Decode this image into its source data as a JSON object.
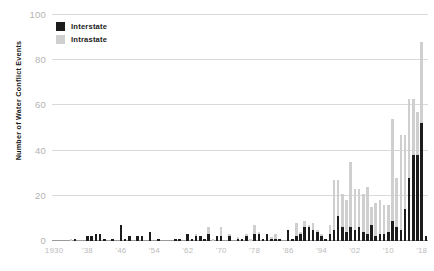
{
  "chart_data": {
    "type": "bar",
    "subtype": "stacked-vertical",
    "title": "",
    "subtitle": "",
    "xlabel": "",
    "ylabel": "Number of Water Conflict Events",
    "ylim": [
      0,
      100
    ],
    "ytick_values": [
      0,
      20,
      40,
      60,
      80,
      100
    ],
    "ytick_labels": [
      "0",
      "20",
      "40",
      "60",
      "80",
      "100"
    ],
    "grid": "horizontal",
    "legend_position": "top-left",
    "colors": {
      "interstate": "#1c1c1c",
      "intrastate": "#cfcfcf",
      "gridline": "#d9d9d9",
      "axis_text": "#bdbdbd",
      "label_text": "#1a1a1a",
      "background": "#ffffff"
    },
    "xtick_labels": [
      "1930",
      "'38",
      "'46",
      "'54",
      "'62",
      "'70",
      "'78",
      "'86",
      "'94",
      "'02",
      "'10",
      "'18"
    ],
    "xtick_years": [
      1930,
      1938,
      1946,
      1954,
      1962,
      1970,
      1978,
      1986,
      1994,
      2002,
      2010,
      2018
    ],
    "x": [
      1930,
      1931,
      1932,
      1933,
      1934,
      1935,
      1936,
      1937,
      1938,
      1939,
      1940,
      1941,
      1942,
      1943,
      1944,
      1945,
      1946,
      1947,
      1948,
      1949,
      1950,
      1951,
      1952,
      1953,
      1954,
      1955,
      1956,
      1957,
      1958,
      1959,
      1960,
      1961,
      1962,
      1963,
      1964,
      1965,
      1966,
      1967,
      1968,
      1969,
      1970,
      1971,
      1972,
      1973,
      1974,
      1975,
      1976,
      1977,
      1978,
      1979,
      1980,
      1981,
      1982,
      1983,
      1984,
      1985,
      1986,
      1987,
      1988,
      1989,
      1990,
      1991,
      1992,
      1993,
      1994,
      1995,
      1996,
      1997,
      1998,
      1999,
      2000,
      2001,
      2002,
      2003,
      2004,
      2005,
      2006,
      2007,
      2008,
      2009,
      2010,
      2011,
      2012,
      2013,
      2014,
      2015,
      2016,
      2017,
      2018,
      2019
    ],
    "series": [
      {
        "name": "Interstate",
        "color": "#1c1c1c",
        "values": [
          0,
          0,
          0,
          0,
          0,
          1,
          0,
          0,
          2,
          2,
          3,
          3,
          1,
          0,
          1,
          0,
          7,
          1,
          2,
          0,
          2,
          2,
          0,
          4,
          0,
          1,
          0,
          0,
          0,
          1,
          1,
          0,
          3,
          1,
          2,
          2,
          1,
          3,
          0,
          2,
          2,
          0,
          2,
          0,
          1,
          1,
          2,
          0,
          3,
          3,
          1,
          3,
          1,
          1,
          1,
          0,
          5,
          1,
          2,
          3,
          6,
          6,
          5,
          4,
          2,
          1,
          3,
          5,
          11,
          6,
          4,
          6,
          5,
          6,
          4,
          3,
          7,
          2,
          3,
          3,
          4,
          9,
          6,
          5,
          14,
          28,
          38,
          38,
          52,
          2
        ]
      },
      {
        "name": "Intrastate",
        "color": "#cfcfcf",
        "values": [
          0,
          0,
          0,
          0,
          1,
          0,
          0,
          0,
          0,
          0,
          0,
          0,
          0,
          0,
          0,
          0,
          0,
          0,
          0,
          0,
          0,
          0,
          0,
          0,
          0,
          0,
          0,
          0,
          0,
          0,
          0,
          0,
          0,
          0,
          1,
          0,
          0,
          3,
          1,
          0,
          4,
          0,
          1,
          0,
          1,
          0,
          1,
          1,
          4,
          1,
          0,
          0,
          1,
          2,
          0,
          0,
          0,
          0,
          6,
          1,
          3,
          1,
          3,
          1,
          1,
          0,
          4,
          22,
          16,
          15,
          14,
          29,
          18,
          17,
          17,
          21,
          8,
          15,
          15,
          13,
          12,
          45,
          22,
          42,
          33,
          35,
          25,
          19,
          36,
          0
        ]
      }
    ],
    "totals": [
      0,
      0,
      0,
      0,
      1,
      1,
      0,
      0,
      2,
      2,
      3,
      3,
      1,
      0,
      1,
      0,
      7,
      1,
      2,
      0,
      2,
      2,
      0,
      4,
      0,
      1,
      0,
      0,
      0,
      1,
      1,
      0,
      3,
      1,
      3,
      2,
      1,
      6,
      1,
      2,
      6,
      0,
      3,
      0,
      2,
      1,
      3,
      1,
      7,
      4,
      1,
      3,
      2,
      3,
      1,
      0,
      5,
      1,
      8,
      4,
      9,
      7,
      8,
      5,
      3,
      1,
      7,
      27,
      27,
      21,
      18,
      35,
      23,
      23,
      21,
      24,
      15,
      17,
      18,
      16,
      16,
      54,
      28,
      47,
      47,
      63,
      63,
      57,
      88,
      2
    ],
    "max_value": 88,
    "annotations": []
  },
  "legend": {
    "items": [
      {
        "label": "Interstate",
        "swatch": "legend-swatch-interstate"
      },
      {
        "label": "Intrastate",
        "swatch": "legend-swatch-intrastate"
      }
    ]
  }
}
